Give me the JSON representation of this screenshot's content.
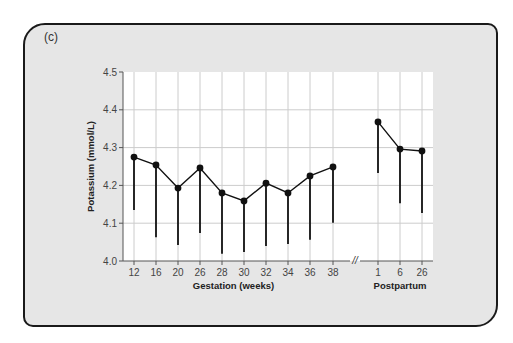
{
  "panel_label": "(c)",
  "chart_data": {
    "type": "line",
    "title": "",
    "ylabel": "Potassium (mmol/L)",
    "ylim": [
      4.0,
      4.5
    ],
    "yticks": [
      "4.0",
      "4.1",
      "4.2",
      "4.3",
      "4.4",
      "4.5"
    ],
    "grid": true,
    "groups": [
      {
        "xlabel": "Gestation (weeks)",
        "categories": [
          "12",
          "16",
          "20",
          "26",
          "28",
          "30",
          "32",
          "34",
          "36",
          "38"
        ],
        "values": [
          4.275,
          4.254,
          4.193,
          4.246,
          4.18,
          4.159,
          4.206,
          4.18,
          4.225,
          4.249
        ],
        "lower_error": [
          4.135,
          4.063,
          4.042,
          4.074,
          4.019,
          4.024,
          4.04,
          4.045,
          4.056,
          4.101
        ]
      },
      {
        "xlabel": "Postpartum",
        "categories": [
          "1",
          "6",
          "26"
        ],
        "values": [
          4.368,
          4.296,
          4.291
        ],
        "lower_error": [
          4.233,
          4.153,
          4.127
        ]
      }
    ],
    "axis_break": "//"
  },
  "colors": {
    "card_bg": "#e6e6e6",
    "plot_bg": "#ffffff",
    "grid": "#cccccc",
    "line": "#111111"
  }
}
